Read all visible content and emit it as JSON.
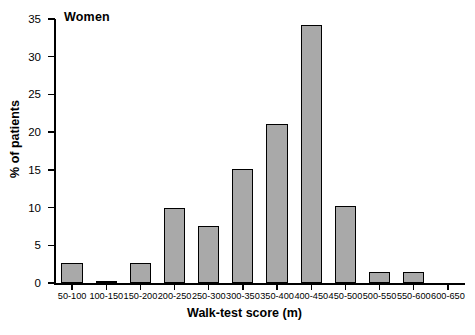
{
  "chart_data": {
    "type": "bar",
    "title": "Women",
    "xlabel": "Walk-test score (m)",
    "ylabel": "% of patients",
    "categories": [
      "50-100",
      "100-150",
      "150-200",
      "200-250",
      "250-300",
      "300-350",
      "350-400",
      "400-450",
      "450-500",
      "500-550",
      "550-600",
      "600-650"
    ],
    "values": [
      2.7,
      0.2,
      2.7,
      10.0,
      7.5,
      15.1,
      21.1,
      34.2,
      10.2,
      1.5,
      1.5,
      0
    ],
    "ylim": [
      0,
      35
    ],
    "yticks": [
      0,
      5,
      10,
      15,
      20,
      25,
      30,
      35
    ],
    "ytick_labels": [
      "0",
      "5",
      "10",
      "15",
      "20",
      "25",
      "30",
      "35"
    ],
    "grid": false,
    "legend": "none",
    "bar_color": "#a9a9a9",
    "bar_edge_color": "#000000",
    "axis_color": "#000000"
  }
}
